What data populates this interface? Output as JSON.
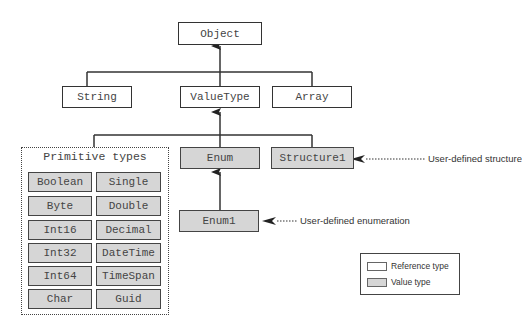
{
  "diagram": {
    "title": "Object",
    "nodes": {
      "object": "Object",
      "string": "String",
      "valuetype": "ValueType",
      "array": "Array",
      "enum": "Enum",
      "structure1": "Structure1",
      "enum1": "Enum1"
    },
    "primitive_group": {
      "title": "Primitive types",
      "items": [
        "Boolean",
        "Single",
        "Byte",
        "Double",
        "Int16",
        "Decimal",
        "Int32",
        "DateTime",
        "Int64",
        "TimeSpan",
        "Char",
        "Guid"
      ]
    },
    "annotations": {
      "structure": "User-defined structure",
      "enumeration": "User-defined enumeration"
    },
    "legend": {
      "reference": "Reference type",
      "value": "Value type"
    },
    "colors": {
      "reference_fill": "#ffffff",
      "value_fill": "#d6d6d6",
      "stroke": "#333333"
    }
  }
}
